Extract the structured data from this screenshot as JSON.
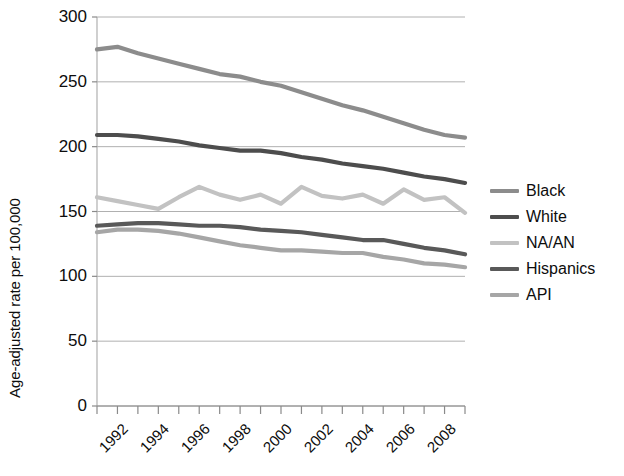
{
  "chart_data": {
    "type": "line",
    "title": "",
    "subtitle": "",
    "xlabel": "",
    "ylabel": "Age-adjusted rate per 100,000",
    "xlim": [
      1991,
      2009
    ],
    "ylim": [
      0,
      300
    ],
    "ytick_step": 50,
    "ytick_labels": [
      "0",
      "50",
      "100",
      "150",
      "200",
      "250",
      "300"
    ],
    "ytick_values": [
      0,
      50,
      100,
      150,
      200,
      250,
      300
    ],
    "xtick_labels": [
      "1992",
      "1994",
      "1996",
      "1998",
      "2000",
      "2002",
      "2004",
      "2006",
      "2008"
    ],
    "xtick_values": [
      1992,
      1994,
      1996,
      1998,
      2000,
      2002,
      2004,
      2006,
      2008
    ],
    "x": [
      1991,
      1992,
      1993,
      1994,
      1995,
      1996,
      1997,
      1998,
      1999,
      2000,
      2001,
      2002,
      2003,
      2004,
      2005,
      2006,
      2007,
      2008,
      2009
    ],
    "grid": "horizontal",
    "legend_position": "right",
    "series": [
      {
        "name": "Black",
        "color": "#8c8c8c",
        "values": [
          275,
          277,
          272,
          268,
          264,
          260,
          256,
          254,
          250,
          247,
          242,
          237,
          232,
          228,
          223,
          218,
          213,
          209,
          207
        ]
      },
      {
        "name": "White",
        "color": "#4d4d4d",
        "values": [
          209,
          209,
          208,
          206,
          204,
          201,
          199,
          197,
          197,
          195,
          192,
          190,
          187,
          185,
          183,
          180,
          177,
          175,
          172
        ]
      },
      {
        "name": "NA/AN",
        "color": "#c2c2c2",
        "values": [
          161,
          158,
          155,
          152,
          161,
          169,
          163,
          159,
          163,
          156,
          169,
          162,
          160,
          163,
          156,
          167,
          159,
          161,
          149
        ]
      },
      {
        "name": "Hispanics",
        "color": "#595959",
        "values": [
          139,
          140,
          141,
          141,
          140,
          139,
          139,
          138,
          136,
          135,
          134,
          132,
          130,
          128,
          128,
          125,
          122,
          120,
          117
        ]
      },
      {
        "name": "API",
        "color": "#a6a6a6",
        "values": [
          134,
          136,
          136,
          135,
          133,
          130,
          127,
          124,
          122,
          120,
          120,
          119,
          118,
          118,
          115,
          113,
          110,
          109,
          107
        ]
      }
    ]
  },
  "axis": {
    "ylabel": "Age-adjusted rate per 100,000"
  },
  "legend": {
    "items": [
      {
        "label": "Black"
      },
      {
        "label": "White"
      },
      {
        "label": "NA/AN"
      },
      {
        "label": "Hispanics"
      },
      {
        "label": "API"
      }
    ]
  }
}
